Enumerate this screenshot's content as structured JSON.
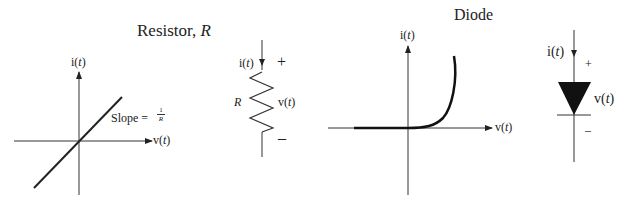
{
  "resistor": {
    "title_prefix": "Resistor, ",
    "title_symbol": "R",
    "graph": {
      "y_axis_label_prefix": "i(",
      "y_axis_label_var": "t",
      "y_axis_label_suffix": ")",
      "x_axis_label_prefix": "v(",
      "x_axis_label_var": "t",
      "x_axis_label_suffix": ")",
      "slope_label": "Slope =",
      "slope_num": "1",
      "slope_den": "R"
    },
    "symbol": {
      "current_prefix": "i(",
      "current_var": "t",
      "current_suffix": ")",
      "plus": "+",
      "minus": "–",
      "label": "R",
      "voltage_prefix": "v(",
      "voltage_var": "t",
      "voltage_suffix": ")"
    }
  },
  "diode": {
    "title": "Diode",
    "graph": {
      "y_axis_label_prefix": "i(",
      "y_axis_label_var": "t",
      "y_axis_label_suffix": ")",
      "x_axis_label_prefix": "v(",
      "x_axis_label_var": "t",
      "x_axis_label_suffix": ")"
    },
    "symbol": {
      "current_prefix": "i(",
      "current_var": "t",
      "current_suffix": ")",
      "plus": "+",
      "minus": "–",
      "voltage_prefix": "v(",
      "voltage_var": "t",
      "voltage_suffix": ")"
    }
  }
}
